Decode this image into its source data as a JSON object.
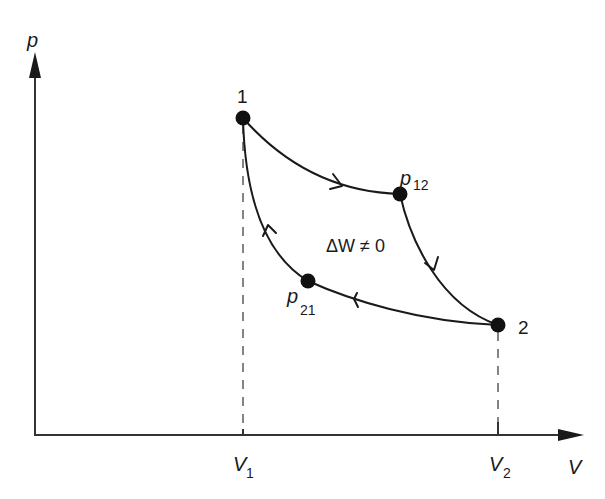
{
  "diagram": {
    "type": "p-V thermodynamic cycle",
    "axes": {
      "y_label": "p",
      "x_label": "V"
    },
    "ticks": {
      "v1": {
        "main": "V",
        "sub": "1"
      },
      "v2": {
        "main": "V",
        "sub": "2"
      }
    },
    "points": {
      "p1": {
        "label": "1"
      },
      "p2": {
        "label": "2"
      },
      "p12": {
        "main": "p",
        "sub": "12"
      },
      "p21": {
        "main": "p",
        "sub": "21"
      }
    },
    "annotation": "ΔW ≠ 0",
    "cycle_direction": "clockwise",
    "path_order": [
      "1",
      "p12",
      "2",
      "p21",
      "1"
    ],
    "colors": {
      "ink": "#1a1a1a",
      "axis": "#333333",
      "background": "#ffffff"
    }
  }
}
